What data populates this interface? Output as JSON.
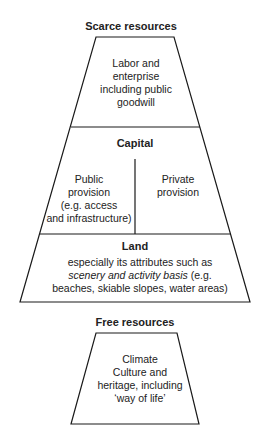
{
  "scarce": {
    "heading": "Scarce resources",
    "labor": {
      "lines": [
        "Labor and",
        "enterprise",
        "including public",
        "goodwill"
      ]
    },
    "capital": {
      "heading": "Capital",
      "public": {
        "lines": [
          "Public",
          "provision",
          "(e.g. access",
          "and infrastructure)"
        ]
      },
      "private": {
        "lines": [
          "Private",
          "provision"
        ]
      }
    },
    "land": {
      "heading": "Land",
      "line1": "especially its attributes such as",
      "line2_italic": "scenery and activity basis",
      "line2_rest": " (e.g.",
      "line3": "beaches, skiable slopes, water areas)"
    }
  },
  "free": {
    "heading": "Free resources",
    "lines": [
      "Climate",
      "Culture and",
      "heritage, including",
      "‘way of life’"
    ]
  },
  "colors": {
    "stroke": "#1a1a1a",
    "background": "#ffffff",
    "text": "#222222"
  }
}
